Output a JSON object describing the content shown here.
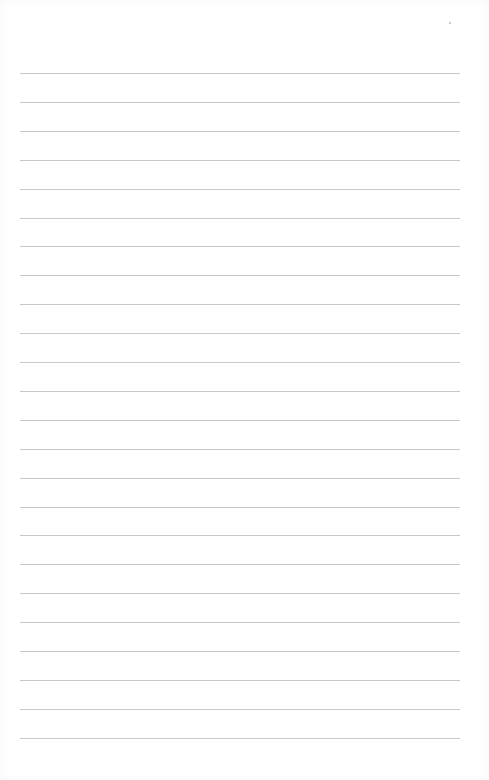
{
  "page": {
    "type": "lined-paper",
    "background_color": "#ffffff",
    "rule_color": "#c9c9c9",
    "rule_count": 24,
    "first_rule_y": 73,
    "rule_spacing": 28.9,
    "rule_left": 20,
    "rule_width": 440
  }
}
